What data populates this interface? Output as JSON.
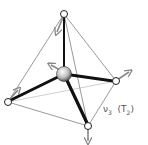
{
  "diagram": {
    "label": {
      "symbol": "ν",
      "index": "3",
      "symmetry_open": "(T",
      "symmetry_index": "2",
      "symmetry_close": ")"
    },
    "atoms": [
      {
        "id": "center",
        "x": 64,
        "y": 74,
        "r": 7.5,
        "type": "central"
      },
      {
        "id": "top",
        "x": 64,
        "y": 14,
        "r": 3.5,
        "type": "ligand"
      },
      {
        "id": "left",
        "x": 8,
        "y": 102,
        "r": 3.5,
        "type": "ligand"
      },
      {
        "id": "right",
        "x": 116,
        "y": 81,
        "r": 3.5,
        "type": "ligand"
      },
      {
        "id": "bottom",
        "x": 88,
        "y": 126,
        "r": 3.5,
        "type": "ligand"
      }
    ],
    "arrows": [
      {
        "from": "top",
        "dx": -6,
        "dy": 16
      },
      {
        "from": "center",
        "dx": -9,
        "dy": -6
      },
      {
        "from": "left",
        "dx": 9,
        "dy": -10
      },
      {
        "from": "right",
        "dx": 12,
        "dy": -8
      },
      {
        "from": "bottom",
        "dx": 0,
        "dy": 14
      }
    ],
    "colors": {
      "bond": "#111111",
      "edge": "#9a9a9a",
      "edge_back": "#cfcfcf",
      "arrow": "#888888",
      "atom_fill": "#ffffff",
      "atom_stroke": "#222222"
    }
  }
}
